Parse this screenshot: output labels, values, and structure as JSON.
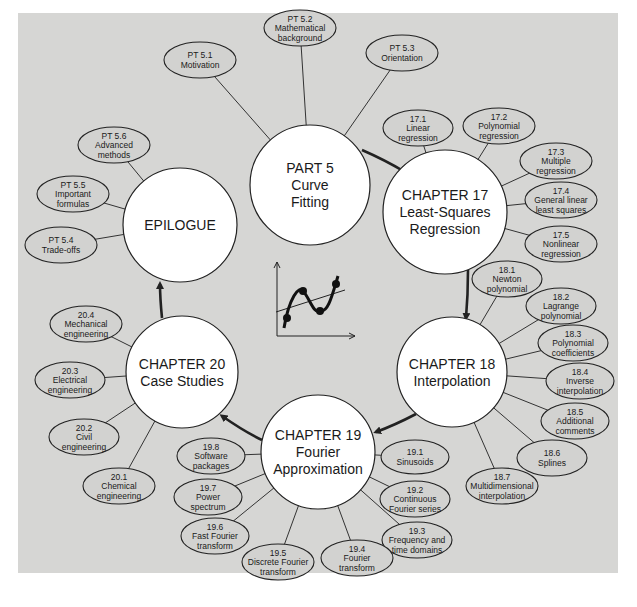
{
  "diagram": {
    "background_color": "#d6d6d4",
    "hubs": [
      {
        "id": "part5",
        "lines": [
          "PART 5",
          "Curve",
          "Fitting"
        ],
        "cx": 310,
        "cy": 185,
        "r": 60
      },
      {
        "id": "ch17",
        "lines": [
          "CHAPTER 17",
          "Least-Squares",
          "Regression"
        ],
        "cx": 445,
        "cy": 212,
        "r": 62
      },
      {
        "id": "ch18",
        "lines": [
          "CHAPTER 18",
          "Interpolation"
        ],
        "cx": 452,
        "cy": 372,
        "r": 55
      },
      {
        "id": "ch19",
        "lines": [
          "CHAPTER 19",
          "Fourier",
          "Approximation"
        ],
        "cx": 318,
        "cy": 452,
        "r": 57
      },
      {
        "id": "ch20",
        "lines": [
          "CHAPTER 20",
          "Case Studies"
        ],
        "cx": 182,
        "cy": 372,
        "r": 56
      },
      {
        "id": "epilogue",
        "lines": [
          "EPILOGUE"
        ],
        "cx": 180,
        "cy": 225,
        "r": 57
      }
    ],
    "subtopics": [
      {
        "hub": "part5",
        "lines": [
          "PT 5.1",
          "Motivation"
        ],
        "cx": 200,
        "cy": 60,
        "rx": 36,
        "ry": 18
      },
      {
        "hub": "part5",
        "lines": [
          "PT 5.2",
          "Mathematical",
          "background"
        ],
        "cx": 300,
        "cy": 28,
        "rx": 36,
        "ry": 18
      },
      {
        "hub": "part5",
        "lines": [
          "PT 5.3",
          "Orientation"
        ],
        "cx": 402,
        "cy": 53,
        "rx": 36,
        "ry": 18
      },
      {
        "hub": "ch17",
        "lines": [
          "17.1",
          "Linear",
          "regression"
        ],
        "cx": 418,
        "cy": 128,
        "rx": 35,
        "ry": 18
      },
      {
        "hub": "ch17",
        "lines": [
          "17.2",
          "Polynomial",
          "regression"
        ],
        "cx": 499,
        "cy": 126,
        "rx": 36,
        "ry": 18
      },
      {
        "hub": "ch17",
        "lines": [
          "17.3",
          "Multiple",
          "regression"
        ],
        "cx": 556,
        "cy": 161,
        "rx": 36,
        "ry": 18
      },
      {
        "hub": "ch17",
        "lines": [
          "17.4",
          "General linear",
          "least squares"
        ],
        "cx": 561,
        "cy": 200,
        "rx": 36,
        "ry": 18
      },
      {
        "hub": "ch17",
        "lines": [
          "17.5",
          "Nonlinear",
          "regression"
        ],
        "cx": 561,
        "cy": 244,
        "rx": 36,
        "ry": 18
      },
      {
        "hub": "ch18",
        "lines": [
          "18.1",
          "Newton",
          "polynomial"
        ],
        "cx": 507,
        "cy": 279,
        "rx": 35,
        "ry": 18
      },
      {
        "hub": "ch18",
        "lines": [
          "18.2",
          "Lagrange",
          "polynomial"
        ],
        "cx": 561,
        "cy": 306,
        "rx": 35,
        "ry": 18
      },
      {
        "hub": "ch18",
        "lines": [
          "18.3",
          "Polynomial",
          "coefficients"
        ],
        "cx": 573,
        "cy": 343,
        "rx": 35,
        "ry": 18
      },
      {
        "hub": "ch18",
        "lines": [
          "18.4",
          "Inverse",
          "interpolation"
        ],
        "cx": 580,
        "cy": 381,
        "rx": 34,
        "ry": 18
      },
      {
        "hub": "ch18",
        "lines": [
          "18.5",
          "Additional",
          "comments"
        ],
        "cx": 575,
        "cy": 421,
        "rx": 34,
        "ry": 18
      },
      {
        "hub": "ch18",
        "lines": [
          "18.6",
          "Splines"
        ],
        "cx": 552,
        "cy": 458,
        "rx": 35,
        "ry": 18
      },
      {
        "hub": "ch18",
        "lines": [
          "18.7",
          "Multidimensional",
          "interpolation"
        ],
        "cx": 502,
        "cy": 486,
        "rx": 36,
        "ry": 18
      },
      {
        "hub": "ch19",
        "lines": [
          "19.1",
          "Sinusoids"
        ],
        "cx": 415,
        "cy": 457,
        "rx": 34,
        "ry": 17
      },
      {
        "hub": "ch19",
        "lines": [
          "19.2",
          "Continuous",
          "Fourier series"
        ],
        "cx": 415,
        "cy": 499,
        "rx": 35,
        "ry": 18
      },
      {
        "hub": "ch19",
        "lines": [
          "19.3",
          "Frequency and",
          "time domains"
        ],
        "cx": 417,
        "cy": 540,
        "rx": 35,
        "ry": 18
      },
      {
        "hub": "ch19",
        "lines": [
          "19.4",
          "Fourier",
          "transform"
        ],
        "cx": 357,
        "cy": 558,
        "rx": 36,
        "ry": 18
      },
      {
        "hub": "ch19",
        "lines": [
          "19.5",
          "Discrete Fourier",
          "transform"
        ],
        "cx": 278,
        "cy": 562,
        "rx": 36,
        "ry": 18
      },
      {
        "hub": "ch19",
        "lines": [
          "19.6",
          "Fast Fourier",
          "transform"
        ],
        "cx": 215,
        "cy": 536,
        "rx": 34,
        "ry": 18
      },
      {
        "hub": "ch19",
        "lines": [
          "19.7",
          "Power",
          "spectrum"
        ],
        "cx": 208,
        "cy": 497,
        "rx": 34,
        "ry": 18
      },
      {
        "hub": "ch19",
        "lines": [
          "19.8",
          "Software",
          "packages"
        ],
        "cx": 211,
        "cy": 456,
        "rx": 34,
        "ry": 18
      },
      {
        "hub": "ch20",
        "lines": [
          "20.1",
          "Chemical",
          "engineering"
        ],
        "cx": 119,
        "cy": 486,
        "rx": 36,
        "ry": 18
      },
      {
        "hub": "ch20",
        "lines": [
          "20.2",
          "Civil",
          "engineering"
        ],
        "cx": 84,
        "cy": 437,
        "rx": 35,
        "ry": 18
      },
      {
        "hub": "ch20",
        "lines": [
          "20.3",
          "Electrical",
          "engineering"
        ],
        "cx": 70,
        "cy": 380,
        "rx": 35,
        "ry": 18
      },
      {
        "hub": "ch20",
        "lines": [
          "20.4",
          "Mechanical",
          "engineering"
        ],
        "cx": 86,
        "cy": 324,
        "rx": 36,
        "ry": 18
      },
      {
        "hub": "epilogue",
        "lines": [
          "PT 5.4",
          "Trade-offs"
        ],
        "cx": 61,
        "cy": 245,
        "rx": 36,
        "ry": 18
      },
      {
        "hub": "epilogue",
        "lines": [
          "PT 5.5",
          "Important",
          "formulas"
        ],
        "cx": 73,
        "cy": 194,
        "rx": 36,
        "ry": 18
      },
      {
        "hub": "epilogue",
        "lines": [
          "PT 5.6",
          "Advanced",
          "methods"
        ],
        "cx": 114,
        "cy": 145,
        "rx": 36,
        "ry": 18
      }
    ],
    "flow_arrows": [
      {
        "from": "part5",
        "to": "ch17",
        "path": "M 362 150 Q 385 160 405 172"
      },
      {
        "from": "ch17",
        "to": "ch18",
        "path": "M 468 270 Q 468 295 466 318"
      },
      {
        "from": "ch18",
        "to": "ch19",
        "path": "M 416 414 Q 395 425 376 432"
      },
      {
        "from": "ch19",
        "to": "ch20",
        "path": "M 262 440 Q 245 432 222 416"
      },
      {
        "from": "ch20",
        "to": "epilogue",
        "path": "M 162 318 Q 160 298 160 284"
      }
    ],
    "center_icon": {
      "name": "curve-fitting-plot",
      "points": [
        [
          287,
          318
        ],
        [
          303,
          291
        ],
        [
          320,
          311
        ],
        [
          336,
          284
        ]
      ],
      "fit_line": [
        [
          276,
          312
        ],
        [
          345,
          290
        ]
      ],
      "axes": {
        "origin": [
          277,
          336
        ],
        "x_end": [
          355,
          336
        ],
        "y_end": [
          277,
          262
        ]
      }
    }
  }
}
